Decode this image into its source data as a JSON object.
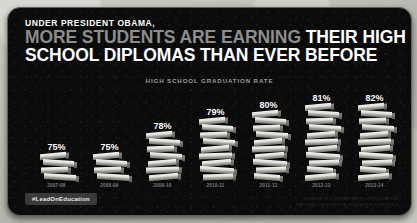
{
  "headline": {
    "kicker": "UNDER PRESIDENT OBAMA,",
    "line1_gray": "MORE STUDENTS ARE EARNING ",
    "line1_white": "THEIR HIGH",
    "line2_white": "SCHOOL DIPLOMAS THAN EVER BEFORE"
  },
  "subtitle": "HIGH SCHOOL GRADUATION RATE",
  "footer": {
    "hashtag": "#LeadOnEducation",
    "source_line1": "SOURCE: U.S. DEPARTMENT OF EDUCATION,",
    "source_line2": "NATIONAL CENTER FOR EDUCATION STATISTICS"
  },
  "colors": {
    "card_background": "#0b0b0b",
    "page_background": "#b9b9b4",
    "headline_gray": "#8d8d8d",
    "headline_white": "#ffffff",
    "subtitle_gray": "#9a9a9a",
    "book_light": "#f2f2ee",
    "book_dark": "#74746e",
    "badge_background": "#3a3a3a"
  },
  "chart_data": {
    "type": "bar",
    "title": "HIGH SCHOOL GRADUATION RATE",
    "xlabel": "",
    "ylabel": "",
    "ylim": [
      0,
      85
    ],
    "grid": false,
    "legend": "none",
    "categories": [
      "2007-08",
      "2008-09",
      "2009-10",
      "2010-11",
      "2011-12",
      "2012-13",
      "2013-14"
    ],
    "values": [
      75,
      75,
      78,
      79,
      80,
      81,
      82
    ],
    "value_labels": [
      "75%",
      "75%",
      "78%",
      "79%",
      "80%",
      "81%",
      "82%"
    ],
    "bar_style": "stacked-books-pictogram",
    "book_counts": [
      4,
      4,
      7,
      9,
      10,
      11,
      11
    ]
  }
}
